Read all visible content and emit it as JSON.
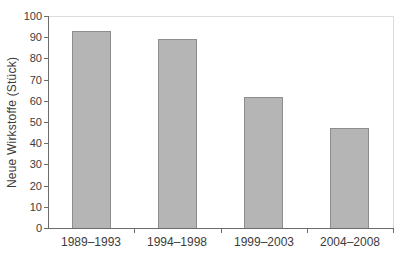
{
  "chart_data": {
    "type": "bar",
    "title": "",
    "ylabel": "Neue Wirkstoffe (Stück)",
    "xlabel": "",
    "categories": [
      "1989–1993",
      "1994–1998",
      "1999–2003",
      "2004–2008"
    ],
    "values": [
      93,
      89,
      62,
      47
    ],
    "ylim": [
      0,
      100
    ],
    "ytick_step": 10,
    "grid": false,
    "legend_position": "none"
  },
  "colors": {
    "bar_fill": "#b5b5b5",
    "bar_border": "#8d8d8d",
    "axis": "#6b6b6b",
    "frame": "#dcdcdc",
    "text": "#3c3c3c",
    "background": "#ffffff"
  }
}
